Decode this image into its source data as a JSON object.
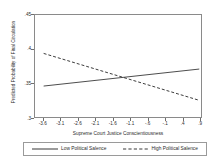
{
  "chart_data": {
    "type": "line",
    "title": "",
    "xlabel": "Supreme Court Justice Conscientiousness",
    "ylabel": "Predicted Probability of Final Circulation",
    "xlim": [
      -3.85,
      0.95
    ],
    "ylim": [
      0.3,
      0.45
    ],
    "xticks": [
      "-3.6",
      "-3.1",
      "-2.6",
      "-2.1",
      "-1.6",
      "-1.1",
      "-.6",
      "-.1",
      ".4",
      ".9"
    ],
    "xtick_values": [
      -3.6,
      -3.1,
      -2.6,
      -2.1,
      -1.6,
      -1.1,
      -0.6,
      -0.1,
      0.4,
      0.9
    ],
    "yticks": [
      ".3",
      ".35",
      ".4",
      ".45"
    ],
    "ytick_values": [
      0.3,
      0.35,
      0.4,
      0.45
    ],
    "grid": false,
    "legend_position": "bottom",
    "series": [
      {
        "name": "Low Political Salence",
        "style": "solid",
        "color": "#4a4a4a",
        "x": [
          -3.6,
          0.9
        ],
        "values": [
          0.3455,
          0.3705
        ]
      },
      {
        "name": "High Political Salence",
        "style": "dashed",
        "color": "#3a3a3a",
        "x": [
          -3.6,
          0.9
        ],
        "values": [
          0.3935,
          0.3245
        ]
      }
    ]
  },
  "legend": {
    "items": [
      {
        "label": "Low Political Salence",
        "style": "solid"
      },
      {
        "label": "High Political Salence",
        "style": "dashed"
      }
    ]
  }
}
